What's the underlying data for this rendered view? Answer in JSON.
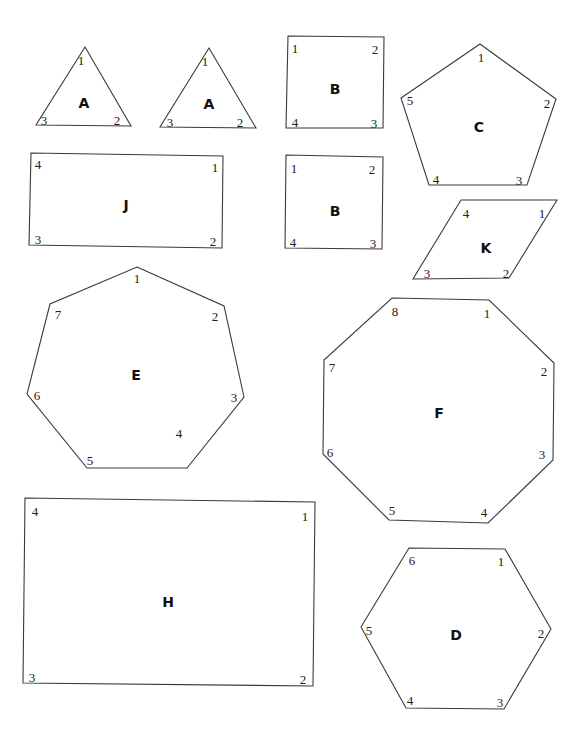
{
  "shapes": [
    {
      "id": "A1",
      "label": "A",
      "type": "triangle",
      "points": [
        [
          85,
          47
        ],
        [
          131,
          126
        ],
        [
          36,
          125
        ]
      ],
      "label_pos": [
        84,
        104
      ],
      "vertices": [
        {
          "n": "1",
          "x": 81,
          "y": 62
        },
        {
          "n": "2",
          "x": 117,
          "y": 122
        },
        {
          "n": "3",
          "x": 44,
          "y": 122
        }
      ]
    },
    {
      "id": "A2",
      "label": "A",
      "type": "triangle",
      "points": [
        [
          209,
          48
        ],
        [
          256,
          128
        ],
        [
          160,
          127
        ]
      ],
      "label_pos": [
        209,
        105
      ],
      "vertices": [
        {
          "n": "1",
          "x": 205,
          "y": 63
        },
        {
          "n": "2",
          "x": 240,
          "y": 124
        },
        {
          "n": "3",
          "x": 170,
          "y": 124
        }
      ]
    },
    {
      "id": "B1",
      "label": "B",
      "type": "square",
      "points": [
        [
          288,
          36
        ],
        [
          384,
          37
        ],
        [
          383,
          128
        ],
        [
          286,
          128
        ]
      ],
      "label_pos": [
        335,
        90
      ],
      "vertices": [
        {
          "n": "1",
          "x": 295,
          "y": 50
        },
        {
          "n": "2",
          "x": 375,
          "y": 51
        },
        {
          "n": "3",
          "x": 374,
          "y": 125
        },
        {
          "n": "4",
          "x": 295,
          "y": 124
        }
      ]
    },
    {
      "id": "B2",
      "label": "B",
      "type": "square",
      "points": [
        [
          286,
          155
        ],
        [
          383,
          157
        ],
        [
          382,
          249
        ],
        [
          285,
          248
        ]
      ],
      "label_pos": [
        335,
        212
      ],
      "vertices": [
        {
          "n": "1",
          "x": 294,
          "y": 170
        },
        {
          "n": "2",
          "x": 372,
          "y": 171
        },
        {
          "n": "3",
          "x": 373,
          "y": 245
        },
        {
          "n": "4",
          "x": 293,
          "y": 244
        }
      ]
    },
    {
      "id": "C",
      "label": "C",
      "type": "pentagon",
      "points": [
        [
          480,
          44
        ],
        [
          556,
          99
        ],
        [
          527,
          185
        ],
        [
          429,
          185
        ],
        [
          401,
          98
        ]
      ],
      "label_pos": [
        479,
        128
      ],
      "vertices": [
        {
          "n": "1",
          "x": 481,
          "y": 59
        },
        {
          "n": "2",
          "x": 547,
          "y": 105
        },
        {
          "n": "3",
          "x": 519,
          "y": 182
        },
        {
          "n": "4",
          "x": 436,
          "y": 181
        },
        {
          "n": "5",
          "x": 410,
          "y": 102
        }
      ]
    },
    {
      "id": "J",
      "label": "J",
      "type": "rectangle",
      "points": [
        [
          31,
          153
        ],
        [
          223,
          156
        ],
        [
          222,
          248
        ],
        [
          29,
          245
        ]
      ],
      "label_pos": [
        126,
        206
      ],
      "vertices": [
        {
          "n": "1",
          "x": 215,
          "y": 169
        },
        {
          "n": "2",
          "x": 213,
          "y": 243
        },
        {
          "n": "3",
          "x": 38,
          "y": 241
        },
        {
          "n": "4",
          "x": 38,
          "y": 166
        }
      ]
    },
    {
      "id": "K",
      "label": "K",
      "type": "parallelogram",
      "points": [
        [
          461,
          200
        ],
        [
          557,
          200
        ],
        [
          509,
          278
        ],
        [
          413,
          279
        ]
      ],
      "label_pos": [
        486,
        249
      ],
      "vertices": [
        {
          "n": "1",
          "x": 542,
          "y": 215
        },
        {
          "n": "2",
          "x": 506,
          "y": 275
        },
        {
          "n": "3",
          "x": 427,
          "y": 275
        },
        {
          "n": "4",
          "x": 466,
          "y": 215
        }
      ]
    },
    {
      "id": "E",
      "label": "E",
      "type": "heptagon",
      "points": [
        [
          137,
          267
        ],
        [
          224,
          306
        ],
        [
          244,
          397
        ],
        [
          187,
          468
        ],
        [
          87,
          468
        ],
        [
          27,
          394
        ],
        [
          50,
          304
        ]
      ],
      "label_pos": [
        136,
        376
      ],
      "vertices": [
        {
          "n": "1",
          "x": 137,
          "y": 280
        },
        {
          "n": "2",
          "x": 215,
          "y": 318
        },
        {
          "n": "3",
          "x": 234,
          "y": 399
        },
        {
          "n": "4",
          "x": 179,
          "y": 435
        },
        {
          "n": "5",
          "x": 90,
          "y": 462
        },
        {
          "n": "6",
          "x": 37,
          "y": 397
        },
        {
          "n": "7",
          "x": 58,
          "y": 316
        }
      ]
    },
    {
      "id": "F",
      "label": "F",
      "type": "octagon",
      "points": [
        [
          392,
          298
        ],
        [
          489,
          300
        ],
        [
          554,
          363
        ],
        [
          553,
          460
        ],
        [
          488,
          523
        ],
        [
          389,
          520
        ],
        [
          323,
          454
        ],
        [
          324,
          360
        ]
      ],
      "label_pos": [
        439,
        414
      ],
      "vertices": [
        {
          "n": "1",
          "x": 487,
          "y": 315
        },
        {
          "n": "2",
          "x": 544,
          "y": 373
        },
        {
          "n": "3",
          "x": 542,
          "y": 456
        },
        {
          "n": "4",
          "x": 484,
          "y": 514
        },
        {
          "n": "5",
          "x": 392,
          "y": 512
        },
        {
          "n": "6",
          "x": 330,
          "y": 454
        },
        {
          "n": "7",
          "x": 332,
          "y": 369
        },
        {
          "n": "8",
          "x": 395,
          "y": 313
        }
      ]
    },
    {
      "id": "H",
      "label": "H",
      "type": "rectangle",
      "points": [
        [
          25,
          498
        ],
        [
          315,
          502
        ],
        [
          313,
          686
        ],
        [
          23,
          683
        ]
      ],
      "label_pos": [
        168,
        603
      ],
      "vertices": [
        {
          "n": "1",
          "x": 305,
          "y": 518
        },
        {
          "n": "2",
          "x": 303,
          "y": 681
        },
        {
          "n": "3",
          "x": 32,
          "y": 679
        },
        {
          "n": "4",
          "x": 35,
          "y": 513
        }
      ]
    },
    {
      "id": "D",
      "label": "D",
      "type": "hexagon",
      "points": [
        [
          409,
          548
        ],
        [
          505,
          549
        ],
        [
          551,
          629
        ],
        [
          504,
          709
        ],
        [
          406,
          708
        ],
        [
          361,
          627
        ]
      ],
      "label_pos": [
        456,
        636
      ],
      "vertices": [
        {
          "n": "1",
          "x": 501,
          "y": 563
        },
        {
          "n": "2",
          "x": 541,
          "y": 635
        },
        {
          "n": "3",
          "x": 500,
          "y": 704
        },
        {
          "n": "4",
          "x": 410,
          "y": 702
        },
        {
          "n": "5",
          "x": 369,
          "y": 632
        },
        {
          "n": "6",
          "x": 412,
          "y": 562
        }
      ]
    }
  ]
}
